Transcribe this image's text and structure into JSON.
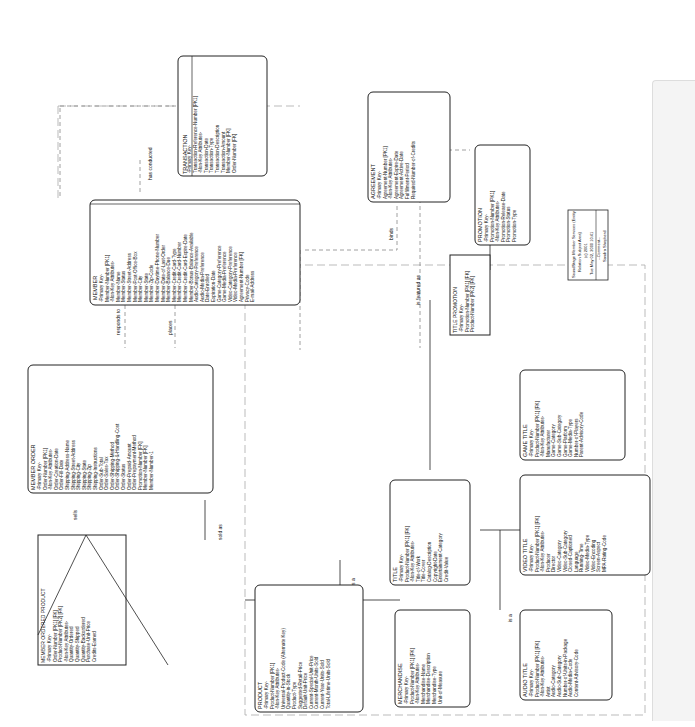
{
  "diagram": {
    "orientation": "rotated-90-ccw",
    "entities": [
      {
        "id": "transaction",
        "name": "TRANSACTION",
        "primary_key_label": "-Primary Key-",
        "primary_keys": [
          "Transaction-Reference-Number [PK1]"
        ],
        "non_key_label": "-Non-Key Attributes-",
        "attributes": [
          "Transaction-Date",
          "Transaction-Type",
          "Transaction-Description",
          "Transaction-Amount",
          "Member-Number [FK]",
          "Order-Number [FK]"
        ]
      },
      {
        "id": "member",
        "name": "MEMBER",
        "primary_key_label": "-Primary Key-",
        "primary_keys": [
          "Member-Number [PK1]"
        ],
        "non_key_label": "-Non-Key Attributes-",
        "attributes": [
          "Member-Name",
          "Member-Status",
          "Member-Street-Address",
          "Member-Post-Office-Box",
          "Member-City",
          "Member-State",
          "Member-Zip-Code",
          "Member-Daytime-Phone-Number",
          "Member-Date-of-Last-Order",
          "Member-Balance-Due",
          "Member-Credit-Card-Type",
          "Member-Credit-Card-Number",
          "Member-Credit-Card-Expire-Date",
          "Member-Bonus-Balance-Available",
          "Audio-Category-Preference",
          "Audio-Media-Preference",
          "Date-Enrolled",
          "Expiration-Date",
          "Game-Category-Preference",
          "Game-Media-Preference",
          "Video-Category-Preference",
          "Video-Media-Preference",
          "Agreement-Number [FK]",
          "Privacy-Code",
          "E-mail-Address"
        ]
      },
      {
        "id": "member_order",
        "name": "MEMBER ORDER",
        "primary_key_label": "-Primary Key-",
        "primary_keys": [
          "Order-Number [PK1]"
        ],
        "non_key_label": "-Non-Key Attributes-",
        "attributes": [
          "Order-Creation-Date",
          "Order-Fill-Date",
          "Shipping-Address-Name",
          "Shipping-Street-Address",
          "Shipping-City",
          "Shipping-State",
          "Shipping-Zip",
          "Shipping-Instructions",
          "Order-Sub-Total",
          "Order-Sales-Tax",
          "Order-Shipping-Method",
          "Order-Shipping-&-Handling-Cost",
          "Order-Status",
          "Order-Prepaid-Amount",
          "Order-Prepayment-Method",
          "Promotion-Number [FK]",
          "Member-Number [FK]",
          "Member-Number-1"
        ],
        "extra_note": "Member-Number [FK]"
      },
      {
        "id": "member_ordered_product",
        "name": "MEMBER ORDERED PRODUCT",
        "primary_key_label": "-Primary Key-",
        "primary_keys": [
          "Order-Number [PK1] [FK]",
          "Product-Number [PK2] [FK]"
        ],
        "non_key_label": "-Non-Key Attributes-",
        "attributes": [
          "Quantity-Ordered",
          "Quantity-Shipped",
          "Quantity-Backordered",
          "Purchase-Unit-Price",
          "Credits-Earned"
        ]
      },
      {
        "id": "agreement",
        "name": "AGREEMENT",
        "primary_key_label": "-Primary Key-",
        "primary_keys": [
          "Agreement-Number [PK1]"
        ],
        "non_key_label": "-Non-Key Attributes-",
        "attributes": [
          "Agreement-Expire-Date",
          "Agreement-Active-Date",
          "Fulfillment-Period",
          "Required-Number-of-Credits"
        ]
      },
      {
        "id": "promotion",
        "name": "PROMOTION",
        "primary_key_label": "-Primary Key-",
        "primary_keys": [
          "Promotion-Number [PK1]"
        ],
        "non_key_label": "-Non-Key Attributes-",
        "attributes": [
          "Promotion-Release-Date",
          "Promotion-Status",
          "Promotion-Type"
        ]
      },
      {
        "id": "title_promotion",
        "name": "TITLE PROMOTION",
        "primary_key_label": "-Primary Key-",
        "primary_keys": [
          "Promotion-Number [PK1] [FK]",
          "Product-Number [PK2] [FK]"
        ],
        "non_key_label": "",
        "attributes": []
      },
      {
        "id": "product",
        "name": "PRODUCT",
        "primary_key_label": "-Primary Key-",
        "primary_keys": [
          "Product-Number [PK1]"
        ],
        "non_key_label": "-Non-Key Attributes-",
        "attributes": [
          "Universal-Product-Code (Alternate Key)",
          "Quantity-in-Stock",
          "Product-Type",
          "Suggested-Retail-Price",
          "Default-Unit-Price",
          "Current-Special-Unit-Price",
          "Current-Month-Units-Sold",
          "Current-Year-Units-Sold",
          "Total-Lifetime-Units-Sold"
        ]
      },
      {
        "id": "merchandise",
        "name": "MERCHANDISE",
        "primary_key_label": "-Primary Key-",
        "primary_keys": [
          "Product-Number [PK1] [FK]"
        ],
        "non_key_label": "-Non-Key Attributes-",
        "attributes": [
          "Merchandise-Name",
          "Merchandise-Description",
          "Merchandise-Type",
          "Unit-of-Measure"
        ]
      },
      {
        "id": "title",
        "name": "TITLE",
        "primary_key_label": "-Primary Key-",
        "primary_keys": [
          "Product-Number [PK1] [FK]"
        ],
        "non_key_label": "-Non-Key Attributes-",
        "attributes": [
          "Title-of-Work",
          "Title-Cover",
          "Catalog-Description",
          "Copyright-Date",
          "Entertainment-Category",
          "Credit-Value"
        ]
      },
      {
        "id": "audio_title",
        "name": "AUDIO TITLE",
        "primary_key_label": "-Primary Key-",
        "primary_keys": [
          "Product-Number [PK1] [FK]"
        ],
        "non_key_label": "-Non-Key Attributes-",
        "attributes": [
          "Artist",
          "Audio-Category",
          "Audio-Sub-Category",
          "Number-of-Units-in-Package",
          "Audio-Media-Code",
          "Content-Advisory-Code"
        ]
      },
      {
        "id": "video_title",
        "name": "VIDEO TITLE",
        "primary_key_label": "-Primary Key-",
        "primary_keys": [
          "Product-Number [PK1] [FK]"
        ],
        "non_key_label": "-Non-Key Attributes-",
        "attributes": [
          "Producer",
          "Director",
          "Video-Category",
          "Video-Sub-Category",
          "Closed-Captioned",
          "Language",
          "Running-Time",
          "Video-Media-Type",
          "Video-Encoding",
          "Screen-Aspect",
          "MPA-Rating-Code"
        ]
      },
      {
        "id": "game_title",
        "name": "GAME TITLE",
        "primary_key_label": "-Primary Key-",
        "primary_keys": [
          "Product-Number [PK1] [FK]"
        ],
        "non_key_label": "-Non-Key Attributes-",
        "attributes": [
          "Manufacturer",
          "Game-Category",
          "Game-Sub-Category",
          "Game-Platform",
          "Game-Media-Type",
          "Number-of-Players",
          "Parent-Advisory-Code"
        ]
      }
    ],
    "relationships": [
      {
        "label": "is a",
        "from": "member_order",
        "to": "transaction"
      },
      {
        "label": "has conducted",
        "from": "member",
        "to": "transaction"
      },
      {
        "label": "responds to",
        "from": "member",
        "to": "member_order"
      },
      {
        "label": "places",
        "from": "member",
        "to": "member_order"
      },
      {
        "label": "binds",
        "from": "agreement",
        "to": "member"
      },
      {
        "label": "sells",
        "from": "member_order",
        "to": "member_ordered_product"
      },
      {
        "label": "sold as",
        "from": "product",
        "to": "member_ordered_product"
      },
      {
        "label": "generates",
        "from": "promotion",
        "to": "member_order"
      },
      {
        "label": "features",
        "from": "promotion",
        "to": "title_promotion"
      },
      {
        "label": "is featured as",
        "from": "title",
        "to": "title_promotion"
      },
      {
        "label": "is a",
        "from": "product",
        "to": "merchandise"
      },
      {
        "label": "is a",
        "from": "product",
        "to": "title"
      },
      {
        "label": "is a",
        "from": "title",
        "to": "audio_title"
      }
    ],
    "info_box": {
      "lines": [
        "SoundStage Member Services (Entity",
        "Relation Subject Area)",
        "(c) 2001",
        "Tue May 02, 2000 10:41"
      ],
      "comment_label": "--Comment--",
      "comment": "Sandra Shepherd"
    }
  }
}
